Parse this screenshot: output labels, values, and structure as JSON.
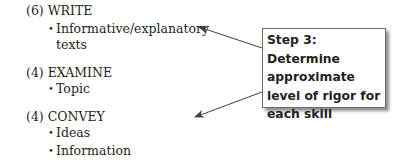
{
  "skills": [
    {
      "heading": "(6) WRITE",
      "items": [
        "Informative/explanatory",
        "texts"
      ]
    },
    {
      "heading": "(4) EXAMINE",
      "items": [
        "Topic"
      ]
    },
    {
      "heading": "(4) CONVEY",
      "items": [
        "Ideas",
        "Information"
      ]
    }
  ],
  "callout": {
    "text": "Step 3: Determine approximate level of rigor for each skill"
  },
  "colors": {
    "text": "#231f20",
    "arrow": "#404041",
    "border": "#6d6e71"
  }
}
